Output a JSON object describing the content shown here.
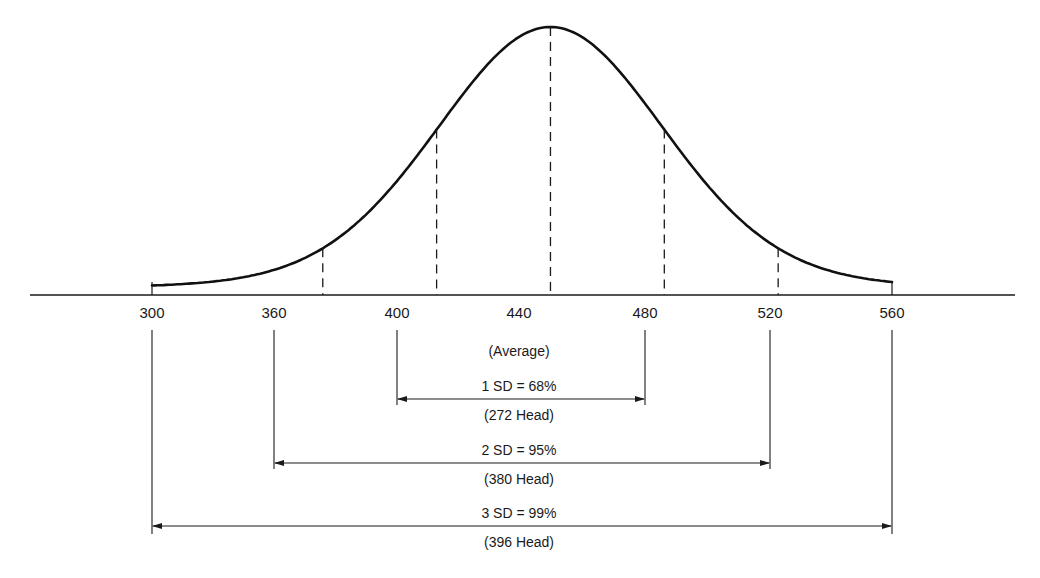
{
  "chart_data": {
    "type": "line",
    "title": "",
    "subtitle": "Normal distribution curve with standard deviation ranges",
    "xlabel": "",
    "ylabel": "",
    "mean": 440,
    "sd": 40,
    "xlim": [
      300,
      560
    ],
    "grid": false,
    "legend": "none",
    "tick_labels": [
      "300",
      "360",
      "400",
      "440",
      "480",
      "520",
      "560"
    ],
    "x": [
      300,
      360,
      400,
      440,
      480,
      520,
      560
    ],
    "mean_label": "(Average)",
    "dashed_markers": [
      360,
      400,
      440,
      480,
      520
    ],
    "ranges": [
      {
        "name": "1 SD",
        "from": 400,
        "to": 480,
        "label": "1 SD = 68%",
        "count_label": "(272 Head)",
        "percent": 68,
        "count": 272
      },
      {
        "name": "2 SD",
        "from": 360,
        "to": 520,
        "label": "2 SD = 95%",
        "count_label": "(380 Head)",
        "percent": 95,
        "count": 380
      },
      {
        "name": "3 SD",
        "from": 300,
        "to": 560,
        "label": "3 SD = 99%",
        "count_label": "(396 Head)",
        "percent": 99,
        "count": 396
      }
    ]
  },
  "colors": {
    "ink": "#1a1a1a",
    "background": "#ffffff"
  }
}
